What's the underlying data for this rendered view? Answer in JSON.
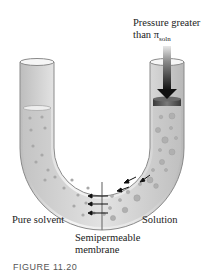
{
  "figure": {
    "caption": "FIGURE 11.20",
    "labels": {
      "pressure_line1": "Pressure greater",
      "pressure_line2_prefix": "than ",
      "pi_symbol": "π",
      "pi_subscript": "soln",
      "left_side": "Pure solvent",
      "right_side": "Solution",
      "membrane_line1": "Semipermeable",
      "membrane_line2": "membrane"
    },
    "colors": {
      "tube_fill": "#d8d8d8",
      "tube_outline": "#888888",
      "particle": "#a8a8a8",
      "arrow": "#1a1a1a",
      "piston": "#555555"
    },
    "elements": {
      "u_tube": "U-shaped glass tube",
      "piston": "piston on solution side",
      "pressure_arrow": "downward pressure arrow",
      "flow_arrows": "solvent flow arrows right-to-left through membrane"
    }
  }
}
